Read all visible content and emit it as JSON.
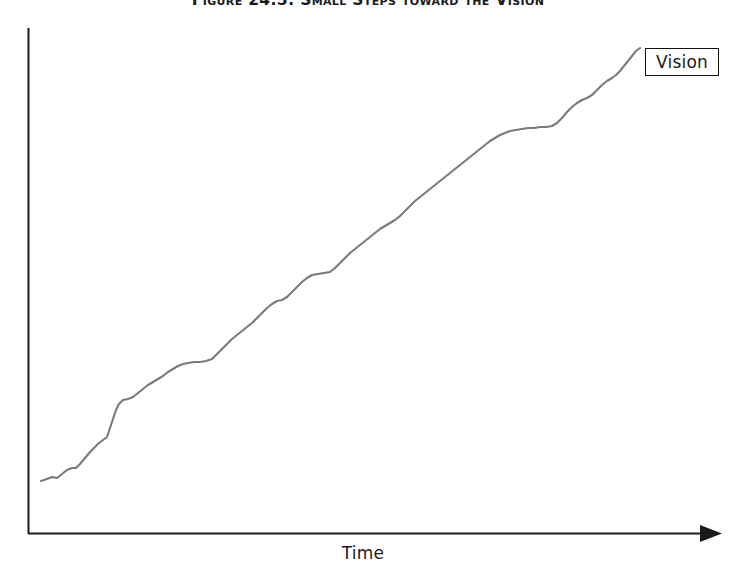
{
  "figure": {
    "title": "Figure 24.5: Small Steps toward the Vision",
    "title_clipped": true
  },
  "axes": {
    "x_label": "Time",
    "y_label": "",
    "x_axis_has_arrow": true,
    "y_axis_has_arrow": false,
    "axis_color": "#1a1a1a",
    "grid": false
  },
  "annotations": {
    "vision_label": "Vision"
  },
  "colors": {
    "line": "#7a7a7a",
    "axis": "#1a1a1a",
    "background": "#ffffff",
    "box_border": "#111111",
    "title": "#1a1a1a"
  },
  "chart_data": {
    "type": "line",
    "title": "Figure 24.5: Small Steps toward the Vision",
    "xlabel": "Time",
    "ylabel": "",
    "grid": false,
    "legend_position": "end-of-line-callout",
    "series": [
      {
        "name": "Vision",
        "color": "#7a7a7a",
        "description": "Steadily rising staircase-like progress curve made of many small incremental steps and short plateaus, climbing from the lower left to the upper right where it reaches the Vision.",
        "points": [
          [
            41,
            481
          ],
          [
            47,
            479
          ],
          [
            52,
            477
          ],
          [
            57,
            478
          ],
          [
            62,
            474
          ],
          [
            67,
            470
          ],
          [
            72,
            468
          ],
          [
            76,
            468
          ],
          [
            80,
            464
          ],
          [
            85,
            458
          ],
          [
            90,
            452
          ],
          [
            95,
            447
          ],
          [
            99,
            443
          ],
          [
            103,
            440
          ],
          [
            107,
            437
          ],
          [
            110,
            428
          ],
          [
            113,
            419
          ],
          [
            116,
            410
          ],
          [
            119,
            404
          ],
          [
            123,
            400
          ],
          [
            128,
            399
          ],
          [
            133,
            397
          ],
          [
            138,
            393
          ],
          [
            143,
            389
          ],
          [
            148,
            385
          ],
          [
            153,
            382
          ],
          [
            158,
            379
          ],
          [
            163,
            376
          ],
          [
            168,
            372
          ],
          [
            173,
            369
          ],
          [
            178,
            366
          ],
          [
            183,
            364
          ],
          [
            188,
            363
          ],
          [
            194,
            362
          ],
          [
            200,
            362
          ],
          [
            206,
            361
          ],
          [
            212,
            359
          ],
          [
            217,
            354
          ],
          [
            222,
            349
          ],
          [
            227,
            344
          ],
          [
            232,
            339
          ],
          [
            237,
            335
          ],
          [
            242,
            331
          ],
          [
            247,
            327
          ],
          [
            252,
            323
          ],
          [
            257,
            318
          ],
          [
            262,
            313
          ],
          [
            267,
            308
          ],
          [
            272,
            304
          ],
          [
            277,
            301
          ],
          [
            282,
            300
          ],
          [
            287,
            297
          ],
          [
            292,
            292
          ],
          [
            297,
            287
          ],
          [
            302,
            282
          ],
          [
            307,
            278
          ],
          [
            312,
            275
          ],
          [
            318,
            274
          ],
          [
            324,
            273
          ],
          [
            330,
            272
          ],
          [
            335,
            268
          ],
          [
            340,
            263
          ],
          [
            345,
            258
          ],
          [
            350,
            253
          ],
          [
            355,
            249
          ],
          [
            360,
            245
          ],
          [
            365,
            241
          ],
          [
            370,
            237
          ],
          [
            375,
            233
          ],
          [
            380,
            229
          ],
          [
            385,
            226
          ],
          [
            390,
            223
          ],
          [
            395,
            220
          ],
          [
            400,
            216
          ],
          [
            405,
            211
          ],
          [
            410,
            206
          ],
          [
            415,
            201
          ],
          [
            420,
            197
          ],
          [
            425,
            193
          ],
          [
            430,
            189
          ],
          [
            435,
            185
          ],
          [
            440,
            181
          ],
          [
            445,
            177
          ],
          [
            450,
            173
          ],
          [
            455,
            169
          ],
          [
            460,
            165
          ],
          [
            465,
            161
          ],
          [
            470,
            157
          ],
          [
            475,
            153
          ],
          [
            480,
            149
          ],
          [
            485,
            145
          ],
          [
            490,
            141
          ],
          [
            495,
            138
          ],
          [
            500,
            135
          ],
          [
            505,
            133
          ],
          [
            510,
            131
          ],
          [
            516,
            130
          ],
          [
            522,
            129
          ],
          [
            528,
            128
          ],
          [
            534,
            128
          ],
          [
            540,
            127
          ],
          [
            546,
            127
          ],
          [
            552,
            126
          ],
          [
            557,
            123
          ],
          [
            562,
            118
          ],
          [
            567,
            112
          ],
          [
            572,
            107
          ],
          [
            577,
            103
          ],
          [
            582,
            100
          ],
          [
            587,
            98
          ],
          [
            592,
            95
          ],
          [
            597,
            90
          ],
          [
            602,
            85
          ],
          [
            607,
            81
          ],
          [
            612,
            78
          ],
          [
            616,
            75
          ],
          [
            620,
            71
          ],
          [
            624,
            66
          ],
          [
            628,
            61
          ],
          [
            632,
            56
          ],
          [
            636,
            51
          ],
          [
            640,
            48
          ]
        ]
      }
    ],
    "xlim": [
      28,
      722
    ],
    "ylim": [
      533,
      28
    ],
    "annotations": [
      {
        "text": "Vision",
        "x": 682,
        "y": 62,
        "boxed": true
      }
    ]
  }
}
